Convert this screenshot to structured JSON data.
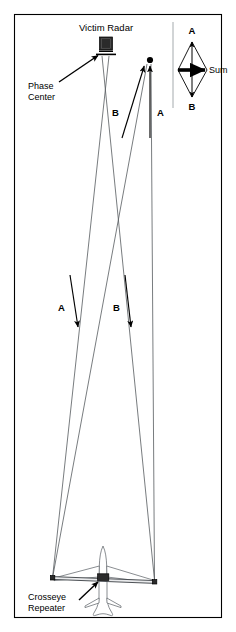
{
  "figure": {
    "title": "Victim Radar",
    "background_color": "#ffffff",
    "border_color": "#000000",
    "beam_color": "#555a5e"
  },
  "labels": {
    "victim_radar": "Victim Radar",
    "phase_center_line1": "Phase",
    "phase_center_line2": "Center",
    "crosseye_line1": "Crosseye",
    "crosseye_line2": "Repeater",
    "upper_b": "B",
    "upper_a": "A",
    "lower_a": "A",
    "lower_b": "B"
  },
  "vector_diagram": {
    "top_label": "A",
    "bottom_label": "B",
    "sum_label": "Sum"
  },
  "icons": {
    "radar_antenna": "radar-antenna-icon",
    "target_dot": "target-dot-icon",
    "aircraft": "aircraft-top-view-icon",
    "repeater_box": "repeater-box-icon"
  }
}
